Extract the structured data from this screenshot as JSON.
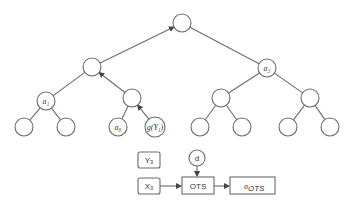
{
  "diagram": {
    "type": "binary-tree-with-flow",
    "tree": {
      "nodes": [
        {
          "id": "root",
          "x": 182,
          "y": 23,
          "label": ""
        },
        {
          "id": "l1a",
          "x": 92,
          "y": 67,
          "label": ""
        },
        {
          "id": "l1b",
          "x": 267,
          "y": 68,
          "label": "a₂"
        },
        {
          "id": "l2a",
          "x": 46,
          "y": 101,
          "label": "a₁"
        },
        {
          "id": "l2b",
          "x": 132,
          "y": 98,
          "label": ""
        },
        {
          "id": "l2c",
          "x": 221,
          "y": 98,
          "label": ""
        },
        {
          "id": "l2d",
          "x": 310,
          "y": 98,
          "label": ""
        },
        {
          "id": "l3a",
          "x": 24,
          "y": 127,
          "label": ""
        },
        {
          "id": "l3b",
          "x": 66,
          "y": 127,
          "label": ""
        },
        {
          "id": "l3c",
          "x": 118,
          "y": 127,
          "label": "a₀"
        },
        {
          "id": "l3d",
          "x": 155,
          "y": 127,
          "label": "g(Y₁)"
        },
        {
          "id": "l3e",
          "x": 200,
          "y": 127,
          "label": ""
        },
        {
          "id": "l3f",
          "x": 242,
          "y": 127,
          "label": ""
        },
        {
          "id": "l3g",
          "x": 288,
          "y": 127,
          "label": ""
        },
        {
          "id": "l3h",
          "x": 330,
          "y": 127,
          "label": ""
        }
      ],
      "edges": [
        {
          "from": "l1a",
          "to": "root",
          "arrow": true
        },
        {
          "from": "root",
          "to": "l1b",
          "arrow": false
        },
        {
          "from": "l1a",
          "to": "l2a",
          "arrow": false
        },
        {
          "from": "l2b",
          "to": "l1a",
          "arrow": true
        },
        {
          "from": "l1b",
          "to": "l2c",
          "arrow": false
        },
        {
          "from": "l1b",
          "to": "l2d",
          "arrow": false
        },
        {
          "from": "l2a",
          "to": "l3a",
          "arrow": false
        },
        {
          "from": "l2a",
          "to": "l3b",
          "arrow": false
        },
        {
          "from": "l2b",
          "to": "l3c",
          "arrow": false
        },
        {
          "from": "l3d",
          "to": "l2b",
          "arrow": true
        },
        {
          "from": "l2c",
          "to": "l3e",
          "arrow": false
        },
        {
          "from": "l2c",
          "to": "l3f",
          "arrow": false
        },
        {
          "from": "l2d",
          "to": "l3g",
          "arrow": false
        },
        {
          "from": "l2d",
          "to": "l3h",
          "arrow": false
        }
      ]
    },
    "flow": {
      "y3_label": "Y₃",
      "x3_label": "X₃",
      "d_label": "d",
      "ots_label": "OTS",
      "sigma_label": "σ",
      "sigma_sub": "OTS"
    }
  }
}
